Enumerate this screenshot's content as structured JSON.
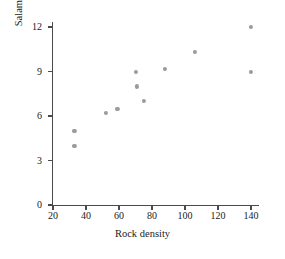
{
  "chart_data": {
    "type": "scatter",
    "title": "",
    "xlabel": "Rock density",
    "ylabel": "Salamander density",
    "xlim": [
      20,
      145
    ],
    "ylim": [
      0,
      12.8
    ],
    "xticks": [
      20,
      40,
      60,
      80,
      100,
      120,
      140
    ],
    "yticks": [
      0,
      3,
      6,
      9,
      12
    ],
    "grid": false,
    "legend": null,
    "point_color": "#9a9a9a",
    "axis_color": "#4a4a4a",
    "text_color": "#1a1a1a",
    "background": "#ffffff",
    "points": [
      {
        "x": 33,
        "y": 5.0
      },
      {
        "x": 33,
        "y": 4.0
      },
      {
        "x": 52,
        "y": 6.2
      },
      {
        "x": 59,
        "y": 6.5
      },
      {
        "x": 70,
        "y": 9.0
      },
      {
        "x": 71,
        "y": 8.0
      },
      {
        "x": 75,
        "y": 7.0
      },
      {
        "x": 88,
        "y": 9.2
      },
      {
        "x": 106,
        "y": 10.3
      },
      {
        "x": 140,
        "y": 12.0
      },
      {
        "x": 140,
        "y": 9.0
      }
    ]
  }
}
